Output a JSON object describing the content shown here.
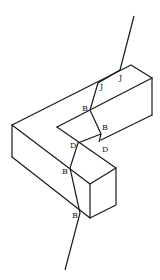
{
  "figure": {
    "labels": [
      {
        "text": "J",
        "x": 119,
        "y": 80
      },
      {
        "text": "J",
        "x": 100,
        "y": 89
      },
      {
        "text": "B",
        "x": 82,
        "y": 111
      },
      {
        "text": "B",
        "x": 102,
        "y": 130
      },
      {
        "text": "D",
        "x": 70,
        "y": 148
      },
      {
        "text": "D",
        "x": 102,
        "y": 152
      },
      {
        "text": "B",
        "x": 62,
        "y": 174
      },
      {
        "text": "B",
        "x": 72,
        "y": 218
      }
    ]
  }
}
